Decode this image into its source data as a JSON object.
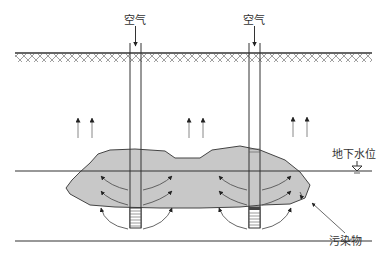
{
  "diagram": {
    "labels": {
      "air_left": "空气",
      "air_right": "空气",
      "water_table": "地下水位",
      "contaminant": "污染物"
    },
    "colors": {
      "plume_fill": "#c8c8c8",
      "line": "#333333",
      "arrow": "#666666"
    }
  }
}
